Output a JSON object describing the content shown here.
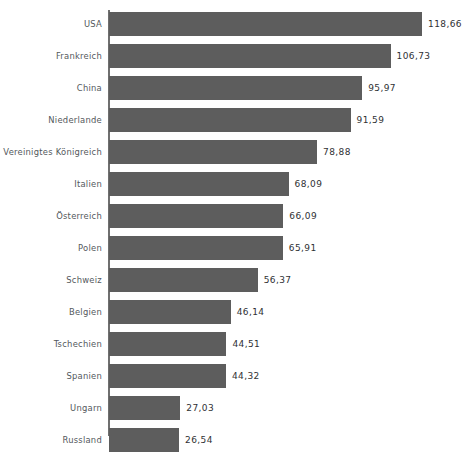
{
  "chart_data": {
    "type": "bar",
    "orientation": "horizontal",
    "title": "",
    "subtitle": "",
    "xlabel": "",
    "ylabel": "",
    "grid": false,
    "legend": false,
    "legend_position": "none",
    "decimal_separator": ",",
    "axis_tick_labels": [],
    "xlim": [
      0,
      118.66
    ],
    "categories": [
      "USA",
      "Frankreich",
      "China",
      "Niederlande",
      "Vereinigtes Königreich",
      "Italien",
      "Österreich",
      "Polen",
      "Schweiz",
      "Belgien",
      "Tschechien",
      "Spanien",
      "Ungarn",
      "Russland",
      "Schweden"
    ],
    "values": [
      118.66,
      106.73,
      95.97,
      91.59,
      78.88,
      68.09,
      66.09,
      65.91,
      56.37,
      46.14,
      44.51,
      44.32,
      27.03,
      26.54,
      24.91
    ],
    "value_labels": [
      "118,66",
      "106,73",
      "95,97",
      "91,59",
      "78,88",
      "68,09",
      "66,09",
      "65,91",
      "56,37",
      "46,14",
      "44,51",
      "44,32",
      "27,03",
      "26,54",
      "24,91"
    ],
    "colors": {
      "bar": "#5d5d5d",
      "axis": "#6f6f6f",
      "category_text": "#53585c",
      "value_text": "#2f3134",
      "background": "#ffffff"
    }
  }
}
